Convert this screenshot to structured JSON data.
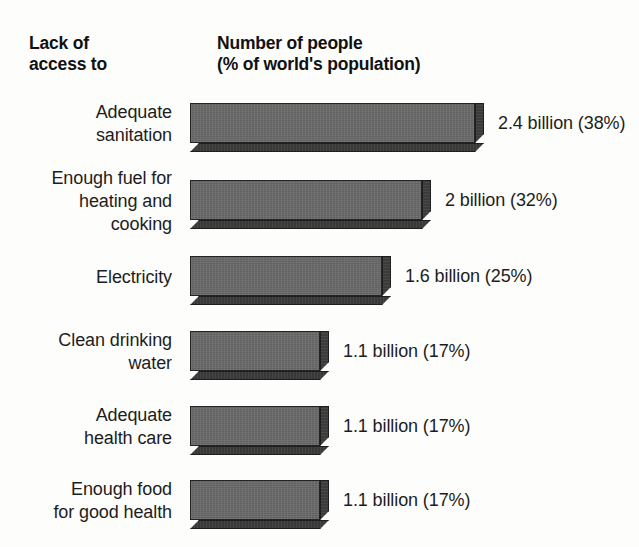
{
  "header": {
    "left_title": "Lack of\naccess to",
    "right_title": "Number of people\n(% of world's population)"
  },
  "style": {
    "bar_face_color": "#6b6b6b",
    "bar_shadow_color": "#3c3c3c",
    "bar_outline_color": "#242424",
    "background_color": "#fdfdfc",
    "text_color": "#1d1d1d"
  },
  "rows": [
    {
      "label": "Adequate\nsanitation",
      "value_label": "2.4 billion (38%)",
      "billions": 2.4,
      "percent": 38
    },
    {
      "label": "Enough fuel for\nheating and\ncooking",
      "value_label": "2 billion (32%)",
      "billions": 2,
      "percent": 32
    },
    {
      "label": "Electricity",
      "value_label": "1.6 billion (25%)",
      "billions": 1.6,
      "percent": 25
    },
    {
      "label": "Clean drinking\nwater",
      "value_label": "1.1 billion (17%)",
      "billions": 1.1,
      "percent": 17
    },
    {
      "label": "Adequate\nhealth care",
      "value_label": "1.1 billion (17%)",
      "billions": 1.1,
      "percent": 17
    },
    {
      "label": "Enough food\nfor good health",
      "value_label": "1.1 billion (17%)",
      "billions": 1.1,
      "percent": 17
    }
  ],
  "chart_data": {
    "type": "bar",
    "orientation": "horizontal",
    "title": "Number of people (% of world's population)",
    "subtitle": "Lack of access to",
    "xlabel": "Number of people (billions)",
    "ylabel": "Lack of access to",
    "categories": [
      "Adequate sanitation",
      "Enough fuel for heating and cooking",
      "Electricity",
      "Clean drinking water",
      "Adequate health care",
      "Enough food for good health"
    ],
    "values": [
      2.4,
      2,
      1.6,
      1.1,
      1.1,
      1.1
    ],
    "percent_of_world_population": [
      38,
      32,
      25,
      17,
      17,
      17
    ],
    "data_labels": [
      "2.4 billion (38%)",
      "2 billion (32%)",
      "1.6 billion (25%)",
      "1.1 billion (17%)",
      "1.1 billion (17%)",
      "1.1 billion (17%)"
    ],
    "xlim": [
      0,
      2.4
    ],
    "grid": false,
    "legend": false,
    "style_3d": true
  },
  "layout": {
    "bar_left_px": 190,
    "bar_face_height_px": 40,
    "depth_px": 9,
    "row_tops_px": [
      103,
      180,
      256,
      331,
      406,
      480
    ],
    "bar_face_widths_px": [
      285,
      232,
      192,
      130,
      130,
      130
    ],
    "label_right_px": 172,
    "value_gap_px": 14
  }
}
